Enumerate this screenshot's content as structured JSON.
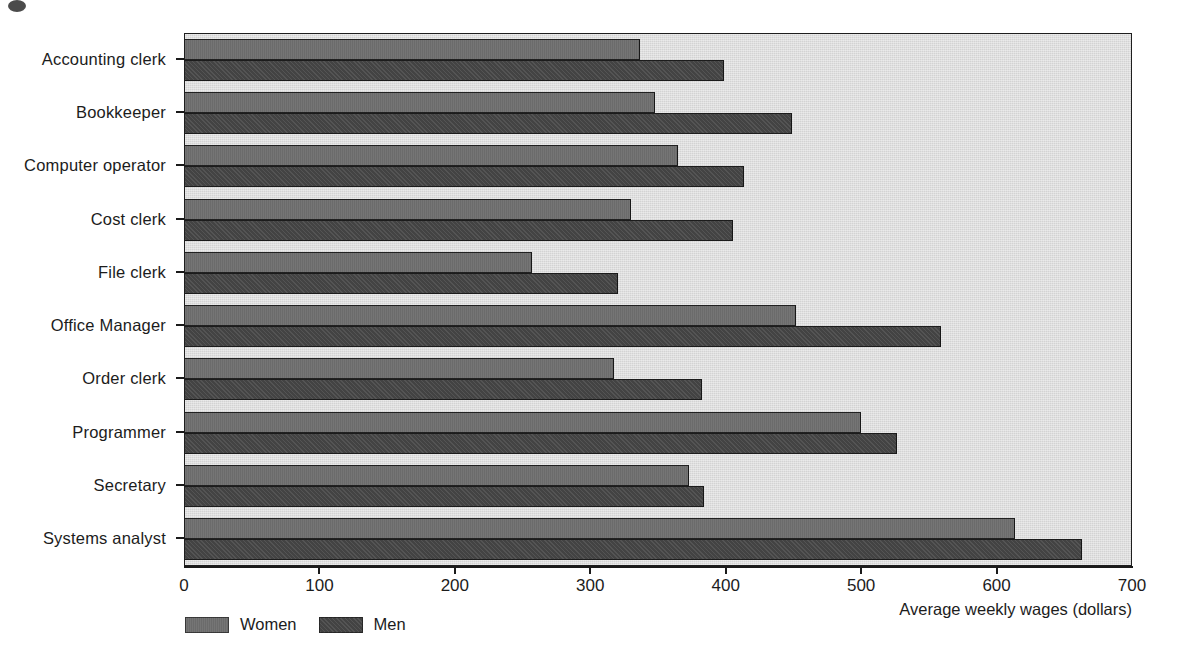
{
  "chart_data": {
    "type": "bar",
    "orientation": "horizontal",
    "title": "",
    "xlabel": "Average weekly wages (dollars)",
    "ylabel": "",
    "xlim": [
      0,
      700
    ],
    "xticks": [
      0,
      100,
      200,
      300,
      400,
      500,
      600,
      700
    ],
    "xtick_labels": [
      "0",
      "100",
      "200",
      "300",
      "400",
      "500",
      "600",
      "700"
    ],
    "grid": false,
    "legend_position": "below-left",
    "categories": [
      "Accounting clerk",
      "Bookkeeper",
      "Computer operator",
      "Cost clerk",
      "File clerk",
      "Office Manager",
      "Order clerk",
      "Programmer",
      "Secretary",
      "Systems analyst"
    ],
    "series": [
      {
        "name": "Women",
        "color": "#6e6e6e",
        "values": [
          336,
          347,
          364,
          329,
          256,
          451,
          317,
          499,
          372,
          613
        ]
      },
      {
        "name": "Men",
        "color": "#474747",
        "values": [
          398,
          448,
          413,
          405,
          320,
          558,
          382,
          526,
          383,
          662
        ]
      }
    ]
  },
  "legend": {
    "items": [
      {
        "label": "Women",
        "swatch": "women"
      },
      {
        "label": "Men",
        "swatch": "men"
      }
    ]
  },
  "axis": {
    "x_title": "Average weekly wages (dollars)"
  },
  "colors": {
    "plot_background": "#d3d3d3",
    "axis": "#1a1a1a",
    "women": "#6e6e6e",
    "men": "#474747"
  }
}
